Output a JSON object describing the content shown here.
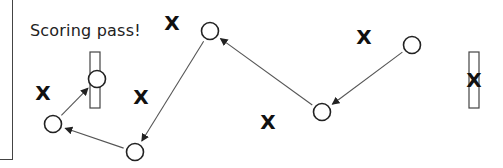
{
  "diagram": {
    "caption": "Scoring pass!",
    "colors": {
      "stroke": "#222222",
      "line": "#555555",
      "background": "#ffffff"
    },
    "goals": [
      {
        "id": "left-goal",
        "x": 90,
        "y": 52,
        "w": 10,
        "h": 56
      },
      {
        "id": "right-goal",
        "x": 469,
        "y": 52,
        "w": 10,
        "h": 56
      }
    ],
    "players_o": [
      {
        "id": "o1",
        "x": 97,
        "y": 79
      },
      {
        "id": "o2",
        "x": 53,
        "y": 124
      },
      {
        "id": "o3",
        "x": 135,
        "y": 152
      },
      {
        "id": "o4",
        "x": 210,
        "y": 31
      },
      {
        "id": "o5",
        "x": 322,
        "y": 112
      },
      {
        "id": "o6",
        "x": 412,
        "y": 45
      }
    ],
    "players_x": [
      {
        "id": "x1",
        "x": 43,
        "y": 93,
        "label": "X"
      },
      {
        "id": "x2",
        "x": 141,
        "y": 97,
        "label": "X"
      },
      {
        "id": "x3",
        "x": 172,
        "y": 23,
        "label": "X"
      },
      {
        "id": "x4",
        "x": 268,
        "y": 122,
        "label": "X"
      },
      {
        "id": "x5",
        "x": 364,
        "y": 37,
        "label": "X"
      },
      {
        "id": "x6",
        "x": 474,
        "y": 80,
        "label": "X"
      }
    ],
    "passes": [
      {
        "from": "o6",
        "to": "o5",
        "arrow": true
      },
      {
        "from": "o5",
        "to": "o4",
        "arrow": true
      },
      {
        "from": "o4",
        "to": "o3",
        "arrow": true
      },
      {
        "from": "o3",
        "to": "o2",
        "arrow": true
      },
      {
        "from": "o2",
        "to": "o1",
        "arrow": true
      }
    ]
  }
}
